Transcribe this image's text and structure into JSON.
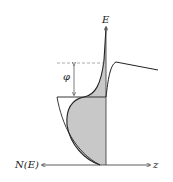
{
  "diagram": {
    "type": "band-diagram",
    "labels": {
      "energy_axis": "E",
      "dos_axis": "N(E)",
      "distance_axis": "z",
      "work_function": "φ"
    },
    "colors": {
      "line": "#222222",
      "fill": "#c8c8c8",
      "dashed": "#888888"
    }
  }
}
